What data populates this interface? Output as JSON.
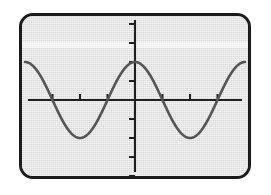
{
  "device": {
    "kind": "graphing-calculator-screen",
    "bezel_color": "#1b1b1b",
    "screen_bg": "#d8d8d8",
    "corner_radius_px": 14
  },
  "chart_data": {
    "type": "line",
    "title": "",
    "subtitle": "",
    "xlabel": "",
    "ylabel": "",
    "legend": [],
    "legend_position": "none",
    "grid": false,
    "axes": {
      "x_axis_visible": true,
      "y_axis_visible": true,
      "x_axis_y_value": 0,
      "y_axis_x_value": 0,
      "xlim": [
        -6.2832,
        6.2832
      ],
      "ylim": [
        -2.2,
        2.2
      ],
      "x_tick_step": 1.5708,
      "y_tick_step": 0.5,
      "x_tick_labels": [],
      "y_tick_labels": [],
      "x_ticks": [
        -6.2832,
        -4.7124,
        -3.1416,
        -1.5708,
        0,
        1.5708,
        3.1416,
        4.7124,
        6.2832
      ],
      "y_ticks": [
        -2.0,
        -1.5,
        -1.0,
        -0.5,
        0.5,
        1.0,
        1.5,
        2.0
      ]
    },
    "series": [
      {
        "name": "cosine-wave",
        "expression": "y = cos(x)",
        "color": "#555555",
        "amplitude": 1.0,
        "periods_shown": 4,
        "phase": "cosine (maximum at x = 0)",
        "x": [
          -6.2832,
          -5.4978,
          -4.7124,
          -3.927,
          -3.1416,
          -2.3562,
          -1.5708,
          -0.7854,
          0,
          0.7854,
          1.5708,
          2.3562,
          3.1416,
          3.927,
          4.7124,
          5.4978,
          6.2832
        ],
        "values": [
          1.0,
          0.7071,
          0,
          -0.7071,
          -1.0,
          -0.7071,
          0,
          0.7071,
          1.0,
          0.7071,
          0,
          -0.7071,
          -1.0,
          -0.7071,
          0,
          0.7071,
          1.0
        ],
        "peaks_at_x": [
          -6.2832,
          -3.1416,
          0,
          3.1416,
          6.2832
        ],
        "troughs_at_x": [
          -4.7124,
          -1.5708,
          1.5708,
          4.7124
        ],
        "peak_value": 1.0,
        "trough_value": -1.0
      }
    ]
  }
}
